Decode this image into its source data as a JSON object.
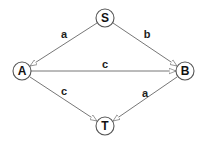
{
  "diagram": {
    "type": "directed-graph",
    "nodes": [
      {
        "id": "S",
        "label": "S",
        "x": 105,
        "y": 18
      },
      {
        "id": "A",
        "label": "A",
        "x": 22,
        "y": 71
      },
      {
        "id": "B",
        "label": "B",
        "x": 185,
        "y": 71
      },
      {
        "id": "T",
        "label": "T",
        "x": 105,
        "y": 126
      }
    ],
    "edges": [
      {
        "from": "S",
        "to": "A",
        "label": "a"
      },
      {
        "from": "S",
        "to": "B",
        "label": "b"
      },
      {
        "from": "A",
        "to": "B",
        "label": "c"
      },
      {
        "from": "A",
        "to": "T",
        "label": "c"
      },
      {
        "from": "B",
        "to": "T",
        "label": "a"
      }
    ],
    "colors": {
      "edge": "#777777",
      "node_stroke": "#555555",
      "text": "#111111"
    }
  }
}
